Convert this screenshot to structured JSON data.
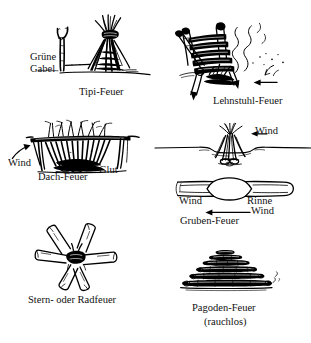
{
  "document": {
    "title": "Feuerarten",
    "language": "de",
    "ink_color": "#111111",
    "background_color": "#ffffff",
    "style": "pen-and-ink line drawing"
  },
  "figures": [
    {
      "id": "tipi",
      "name": "Tipi-Feuer",
      "caption": "Tipi-Feuer",
      "annotations": [
        {
          "id": "gruene-gabel",
          "line1": "Grüne",
          "line2": "Gabel"
        }
      ]
    },
    {
      "id": "lehnstuhl",
      "name": "Lehnstuhl-Feuer",
      "caption": "Lehnstuhl-Feuer",
      "annotations": []
    },
    {
      "id": "dach",
      "name": "Dach-Feuer",
      "caption": "Dach-Feuer",
      "annotations": [
        {
          "id": "wind",
          "label": "Wind"
        },
        {
          "id": "glut",
          "label": "Glut"
        }
      ]
    },
    {
      "id": "gruben",
      "name": "Gruben-Feuer",
      "caption": "Gruben-Feuer",
      "annotations": [
        {
          "id": "wind-side",
          "label": "Wind"
        },
        {
          "id": "wind-left",
          "label": "Wind"
        },
        {
          "id": "rinne",
          "label": "Rinne"
        },
        {
          "id": "wind-bottom",
          "label": "Wind"
        }
      ]
    },
    {
      "id": "stern",
      "name": "Stern- oder Radfeuer",
      "caption": "Stern- oder Radfeuer",
      "annotations": []
    },
    {
      "id": "pagoden",
      "name": "Pagoden-Feuer",
      "caption": "Pagoden-Feuer",
      "subcaption": "(rauchlos)",
      "annotations": []
    }
  ]
}
